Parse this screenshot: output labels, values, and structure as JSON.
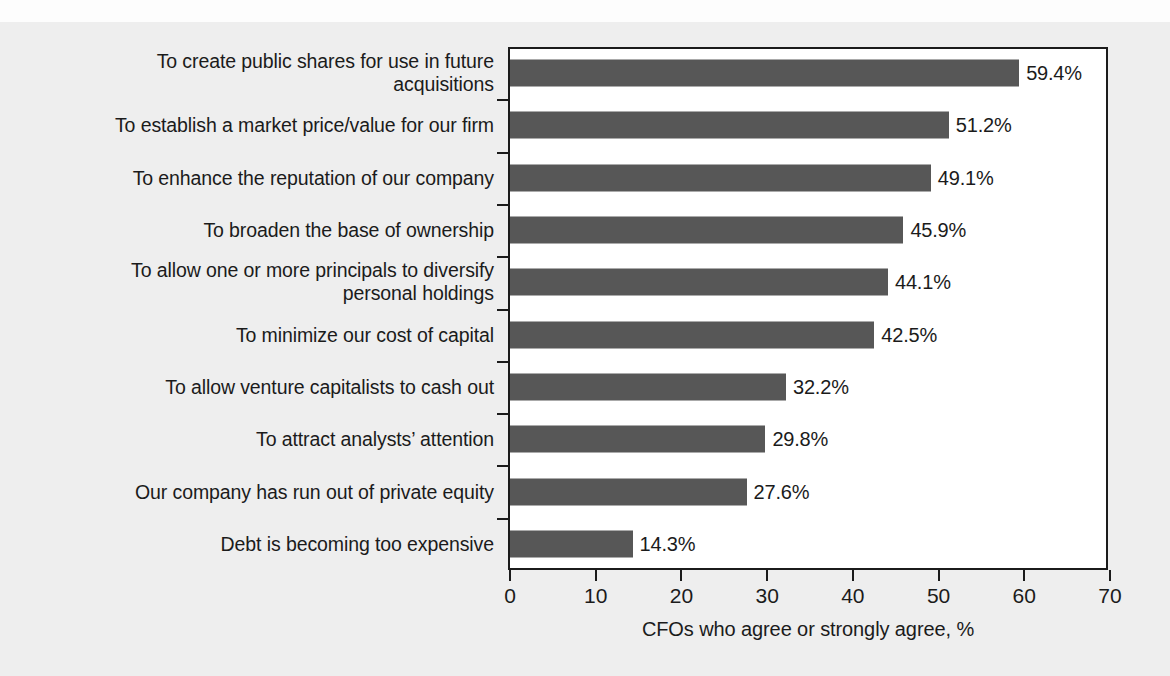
{
  "chart_data": {
    "type": "bar",
    "orientation": "horizontal",
    "title": "",
    "subtitle": "",
    "xlabel": "CFOs who agree or strongly agree, %",
    "ylabel": "",
    "xlim": [
      0,
      70
    ],
    "xticks": [
      0,
      10,
      20,
      30,
      40,
      50,
      60,
      70
    ],
    "xticklabels": [
      "0",
      "10",
      "20",
      "30",
      "40",
      "50",
      "60",
      "70"
    ],
    "grid": false,
    "legend": null,
    "bar_color": "#575757",
    "text_color": "#1b1b1b",
    "background_color": "#eeeeee",
    "plot_background_color": "#ffffff",
    "value_suffix": "%",
    "categories": [
      "To create public shares for use in future\nacquisitions",
      "To establish a market price/value for our firm",
      "To enhance the reputation of our company",
      "To broaden the base of ownership",
      "To allow one or more principals to diversify\npersonal holdings",
      "To minimize our cost of capital",
      "To allow venture capitalists to cash out",
      "To attract analysts’ attention",
      "Our company has run out of private equity",
      "Debt is becoming too expensive"
    ],
    "values": [
      59.4,
      51.2,
      49.1,
      45.9,
      44.1,
      42.5,
      32.2,
      29.8,
      27.6,
      14.3
    ],
    "value_labels": [
      "59.4%",
      "51.2%",
      "49.1%",
      "45.9%",
      "44.1%",
      "42.5%",
      "32.2%",
      "29.8%",
      "27.6%",
      "14.3%"
    ]
  }
}
